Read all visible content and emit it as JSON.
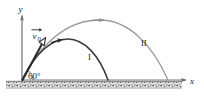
{
  "figure": {
    "type": "physics-diagram",
    "background_color": "#ffffff",
    "ink_color": "#1a1a1a"
  },
  "axes": {
    "y_label": "y",
    "x_label": "x",
    "origin_px": [
      22,
      80
    ],
    "y_axis_top_px": [
      22,
      14
    ],
    "x_axis_right_px": [
      188,
      80
    ],
    "axis_color": "#6b6b6b"
  },
  "vector": {
    "name": "initial-velocity",
    "symbol": "v",
    "subscript": "0",
    "has_overarrow": true,
    "label_text": "v",
    "arrow_style": "hollow-head",
    "color": "#2b2b2b"
  },
  "angle": {
    "label": "60°",
    "value": 60,
    "unit": "degrees",
    "vertex_px": [
      22,
      80
    ]
  },
  "trajectories": [
    {
      "id": "I",
      "label": "I",
      "color": "#3a3a3a",
      "stroke_width": 1.4,
      "launch_px": [
        22,
        80
      ],
      "apex_px": [
        68,
        39
      ],
      "landing_px": [
        108,
        80
      ],
      "label_px": [
        90,
        57
      ],
      "direction_arrow_at": "apex-left"
    },
    {
      "id": "II",
      "label": "II",
      "color": "#9a9a9a",
      "stroke_width": 1.3,
      "launch_px": [
        22,
        80
      ],
      "apex_px": [
        100,
        20
      ],
      "landing_px": [
        168,
        80
      ],
      "label_px": [
        144,
        44
      ],
      "direction_arrow_at": "apex"
    }
  ],
  "ground": {
    "name": "hatched-ground",
    "top_px": 81,
    "height_px": 7,
    "left_px": 6,
    "right_px": 182,
    "fill": "#d8d8d8",
    "speckle_color": "#3a3a3a"
  }
}
